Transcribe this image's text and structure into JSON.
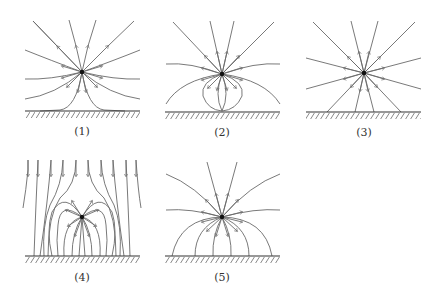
{
  "figure": {
    "panels": [
      {
        "id": 1,
        "label": "(1)",
        "description": "Field lines radiate from charge; lower lines bend down and become tangent to the plane"
      },
      {
        "id": 2,
        "label": "(2)",
        "description": "Field lines radiate from charge; some loops curve back toward a point on the plane"
      },
      {
        "id": 3,
        "label": "(3)",
        "description": "Straight radial field lines; lower ones terminate on plane without bending"
      },
      {
        "id": 4,
        "label": "(4)",
        "description": "Uniform downward field lines from above combined with charge field, all terminating perpendicular on plane"
      },
      {
        "id": 5,
        "label": "(5)",
        "description": "Field lines radiate from charge; lower ones curve and terminate perpendicular to the plane"
      }
    ]
  },
  "colors": {
    "line": "#6a6a6a",
    "ground": "#333333",
    "charge": "#111111",
    "background": "#ffffff"
  }
}
